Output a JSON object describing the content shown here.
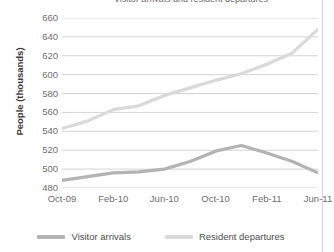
{
  "chart_data": {
    "type": "line",
    "title": "Visitor arrivals and resident departures",
    "xlabel": "",
    "ylabel": "People (thousands)",
    "ylim": [
      480,
      660
    ],
    "yticks": [
      660,
      640,
      620,
      600,
      580,
      560,
      540,
      520,
      500,
      480
    ],
    "grid": true,
    "legend_position": "bottom",
    "x": [
      "Oct-09",
      "Dec-09",
      "Feb-10",
      "Apr-10",
      "Jun-10",
      "Aug-10",
      "Oct-10",
      "Dec-10",
      "Feb-11",
      "Apr-11",
      "Jun-11"
    ],
    "xticks": [
      "Oct-09",
      "Feb-10",
      "Jun-10",
      "Oct-10",
      "Feb-11",
      "Jun-11"
    ],
    "series": [
      {
        "name": "Visitor arrivals",
        "color": "#b3b3b3",
        "values": [
          488,
          492,
          496,
          497,
          500,
          508,
          519,
          525,
          517,
          508,
          496
        ]
      },
      {
        "name": "Resident departures",
        "color": "#d9d9d9",
        "values": [
          543,
          551,
          563,
          567,
          578,
          586,
          594,
          601,
          611,
          623,
          648
        ]
      }
    ]
  },
  "axis": {
    "ylabel": "People (thousands)"
  },
  "legend": {
    "items": [
      {
        "label": "Visitor arrivals",
        "color": "#b3b3b3"
      },
      {
        "label": "Resident departures",
        "color": "#d9d9d9"
      }
    ]
  },
  "colors": {
    "gridline": "#cfcfcf",
    "tick_text": "#6e6e6e",
    "axis_title": "#3a3a3a",
    "figure_border": "#d5d5d5",
    "background": "#ffffff"
  }
}
